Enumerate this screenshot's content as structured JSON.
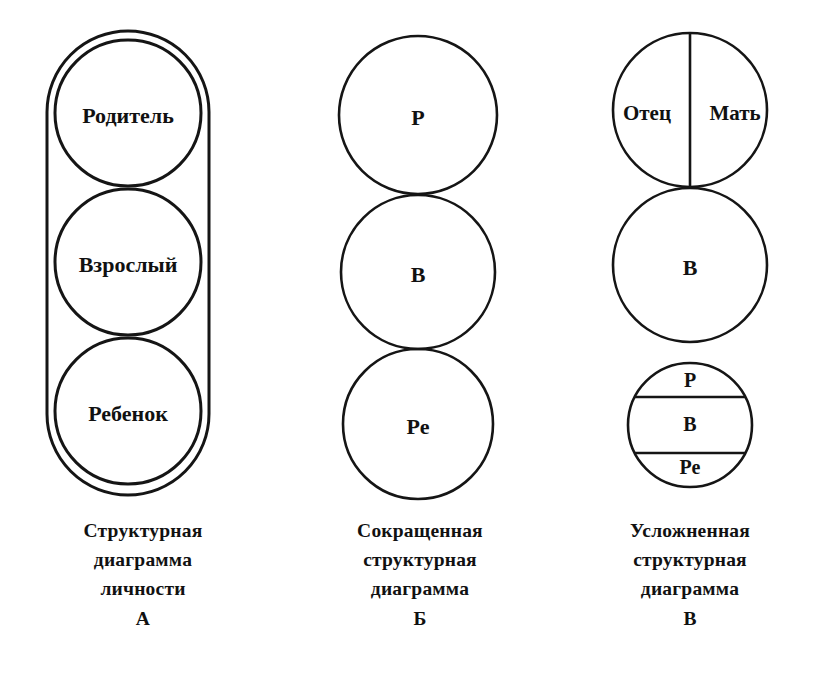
{
  "figure": {
    "background_color": "#ffffff",
    "line_color": "#151515",
    "text_color": "#111111"
  },
  "columns": [
    {
      "key": "А",
      "outline_shape": "stadium",
      "circles": [
        {
          "label": "Родитель"
        },
        {
          "label": "Взрослый"
        },
        {
          "label": "Ребенок"
        }
      ],
      "caption_lines": [
        "Структурная",
        "диаграмма",
        "личности"
      ],
      "caption_key": "А"
    },
    {
      "key": "Б",
      "outline_shape": "none",
      "circles": [
        {
          "label": "Р"
        },
        {
          "label": "В"
        },
        {
          "label": "Ре"
        }
      ],
      "caption_lines": [
        "Сокращенная",
        "структурная",
        "диаграмма"
      ],
      "caption_key": "Б"
    },
    {
      "key": "В",
      "outline_shape": "none",
      "circles": [
        {
          "label": "",
          "split": "vertical",
          "parts": [
            "Отец",
            "Мать"
          ]
        },
        {
          "label": "В"
        },
        {
          "label": "",
          "split": "horizontal",
          "parts": [
            "Р",
            "В",
            "Ре"
          ]
        }
      ],
      "caption_lines": [
        "Усложненная",
        "структурная",
        "диаграмма"
      ],
      "caption_key": "В"
    }
  ]
}
